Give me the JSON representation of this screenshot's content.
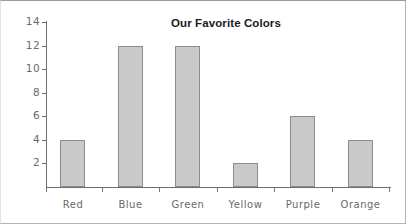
{
  "chart_data": {
    "type": "bar",
    "title": "Our Favorite Colors",
    "xlabel": "",
    "ylabel": "",
    "categories": [
      "Red",
      "Blue",
      "Green",
      "Yellow",
      "Purple",
      "Orange"
    ],
    "values": [
      4,
      12,
      12,
      2,
      6,
      4
    ],
    "ylim": [
      0,
      14
    ],
    "ytick_labels": [
      "14",
      "12",
      "10",
      "8",
      "6",
      "4",
      "2"
    ],
    "ytick_values": [
      14,
      12,
      10,
      8,
      6,
      4,
      2
    ],
    "ytick_step": 2,
    "grid": false,
    "legend": false,
    "legend_position": "none",
    "bar_fill_color": "#c9c9c9",
    "bar_border_color": "#8d8d8d",
    "axis_color": "#6e6e6e",
    "label_color": "#6a6a6a",
    "title_color": "#1a1a1a",
    "background_color": "#ffffff"
  }
}
